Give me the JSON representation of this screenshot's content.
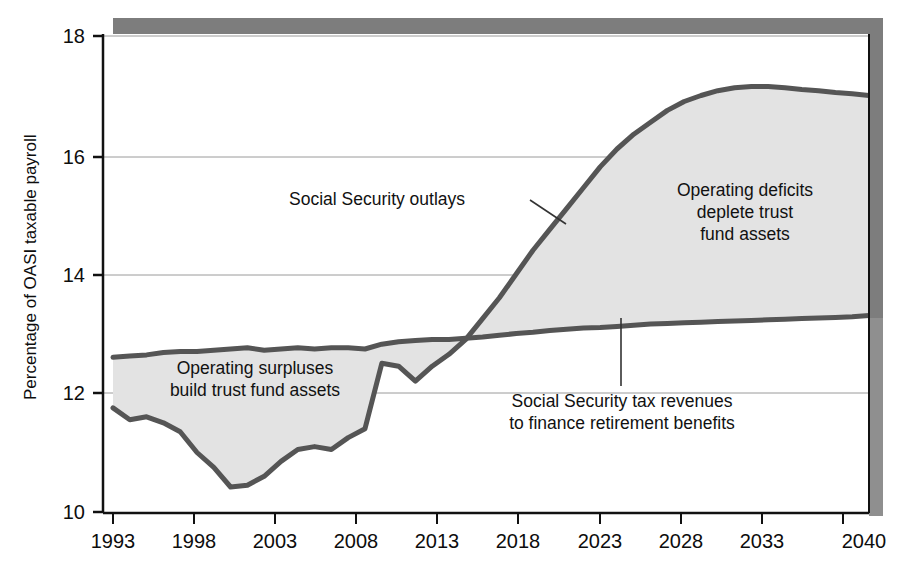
{
  "chart_data": {
    "type": "area",
    "title": "",
    "subtitle": "",
    "xlabel": "",
    "ylabel": "Percentage of OASI taxable payroll",
    "xlim": [
      1993,
      2040
    ],
    "ylim": [
      10,
      18
    ],
    "grid": "horizontal",
    "legend_position": "none",
    "x_tick_labels": [
      "1993",
      "1998",
      "2003",
      "2008",
      "2013",
      "2018",
      "2023",
      "2028",
      "2033",
      "2040"
    ],
    "x_tick_values": [
      1993,
      1998,
      2003,
      2008,
      2013,
      2018,
      2023,
      2028,
      2033,
      2040
    ],
    "y_tick_labels": [
      "10",
      "12",
      "14",
      "16",
      "18"
    ],
    "y_tick_values": [
      10,
      12,
      14,
      16,
      18
    ],
    "x": [
      1993,
      1994,
      1995,
      1996,
      1997,
      1998,
      1999,
      2000,
      2001,
      2002,
      2003,
      2004,
      2005,
      2006,
      2007,
      2008,
      2009,
      2010,
      2011,
      2012,
      2013,
      2014,
      2015,
      2016,
      2017,
      2018,
      2019,
      2020,
      2021,
      2022,
      2023,
      2024,
      2025,
      2026,
      2027,
      2028,
      2029,
      2030,
      2031,
      2032,
      2033,
      2034,
      2035,
      2036,
      2037,
      2038
    ],
    "series": [
      {
        "name": "Social Security tax revenues to finance retirement benefits",
        "role": "revenues",
        "color": "#555555",
        "values": [
          12.6,
          12.62,
          12.64,
          12.68,
          12.7,
          12.7,
          12.72,
          12.74,
          12.76,
          12.72,
          12.74,
          12.76,
          12.74,
          12.76,
          12.76,
          12.74,
          12.82,
          12.86,
          12.88,
          12.9,
          12.9,
          12.92,
          12.94,
          12.97,
          13.0,
          13.02,
          13.05,
          13.07,
          13.09,
          13.1,
          13.12,
          13.14,
          13.16,
          13.17,
          13.18,
          13.19,
          13.2,
          13.21,
          13.22,
          13.23,
          13.24,
          13.25,
          13.26,
          13.27,
          13.28,
          13.3
        ]
      },
      {
        "name": "Social Security outlays",
        "role": "outlays",
        "color": "#555555",
        "values": [
          11.75,
          11.55,
          11.6,
          11.5,
          11.35,
          11.0,
          10.75,
          10.42,
          10.45,
          10.6,
          10.85,
          11.05,
          11.1,
          11.05,
          11.25,
          11.4,
          12.5,
          12.45,
          12.2,
          12.45,
          12.65,
          12.9,
          13.25,
          13.6,
          14.0,
          14.4,
          14.75,
          15.1,
          15.45,
          15.8,
          16.1,
          16.35,
          16.55,
          16.75,
          16.9,
          17.0,
          17.08,
          17.13,
          17.15,
          17.15,
          17.13,
          17.1,
          17.08,
          17.05,
          17.03,
          17.0
        ]
      }
    ],
    "crossover_year": 2016,
    "annotations": [
      {
        "id": "outlays-label",
        "lines": [
          "Social Security outlays"
        ],
        "leader": "diagonal-to-upper-curve"
      },
      {
        "id": "deficits-label",
        "lines": [
          "Operating deficits",
          "deplete trust",
          "fund assets"
        ],
        "leader": "none"
      },
      {
        "id": "surpluses-label",
        "lines": [
          "Operating surpluses",
          "build trust fund assets"
        ],
        "leader": "none"
      },
      {
        "id": "revenues-label",
        "lines": [
          "Social Security tax revenues",
          "to finance retirement benefits"
        ],
        "leader": "vertical-to-lower-curve"
      }
    ],
    "colors": {
      "area_fill": "#e3e3e3",
      "curve_stroke": "#555555",
      "axis": "#111111",
      "gridline": "#999999",
      "shadow": "#8a8a8a",
      "background": "#ffffff"
    }
  }
}
